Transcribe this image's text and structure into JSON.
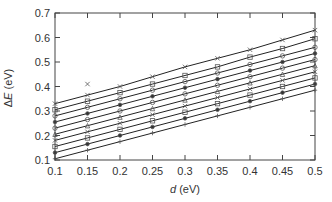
{
  "chart_data": {
    "type": "line",
    "title": "",
    "xlabel": "d (eV)",
    "ylabel": "ΔE (eV)",
    "xlim": [
      0.1,
      0.5
    ],
    "ylim": [
      0.1,
      0.7
    ],
    "xticks": [
      "0.1",
      "0.15",
      "0.2",
      "0.25",
      "0.3",
      "0.35",
      "0.4",
      "0.45",
      "0.5"
    ],
    "yticks": [
      "0.1",
      "0.2",
      "0.3",
      "0.4",
      "0.5",
      "0.6",
      "0.7"
    ],
    "grid": false,
    "legend": null,
    "x": [
      0.1,
      0.15,
      0.2,
      0.25,
      0.3,
      0.35,
      0.4,
      0.45,
      0.5
    ],
    "series": [
      {
        "name": "line1",
        "marker": "x",
        "values": [
          0.33,
          0.365,
          0.4,
          0.44,
          0.48,
          0.515,
          0.55,
          0.59,
          0.63
        ]
      },
      {
        "name": "line2",
        "marker": "square",
        "values": [
          0.305,
          0.34,
          0.375,
          0.41,
          0.445,
          0.48,
          0.52,
          0.555,
          0.595
        ]
      },
      {
        "name": "line3",
        "marker": "circle",
        "values": [
          0.28,
          0.315,
          0.35,
          0.385,
          0.42,
          0.455,
          0.49,
          0.525,
          0.56
        ]
      },
      {
        "name": "line4",
        "marker": "dot",
        "values": [
          0.255,
          0.29,
          0.325,
          0.36,
          0.395,
          0.43,
          0.465,
          0.5,
          0.535
        ]
      },
      {
        "name": "line5",
        "marker": "circle",
        "values": [
          0.23,
          0.265,
          0.3,
          0.335,
          0.37,
          0.405,
          0.44,
          0.475,
          0.51
        ]
      },
      {
        "name": "line6",
        "marker": "triangle",
        "values": [
          0.205,
          0.24,
          0.275,
          0.31,
          0.345,
          0.38,
          0.415,
          0.45,
          0.485
        ]
      },
      {
        "name": "line7",
        "marker": "x",
        "values": [
          0.18,
          0.215,
          0.25,
          0.285,
          0.32,
          0.355,
          0.39,
          0.425,
          0.46
        ]
      },
      {
        "name": "line8",
        "marker": "square",
        "values": [
          0.155,
          0.19,
          0.225,
          0.26,
          0.295,
          0.33,
          0.365,
          0.4,
          0.435
        ]
      },
      {
        "name": "line9",
        "marker": "dot",
        "values": [
          0.13,
          0.165,
          0.2,
          0.235,
          0.27,
          0.305,
          0.34,
          0.375,
          0.41
        ]
      },
      {
        "name": "line10",
        "marker": "plus",
        "values": [
          0.105,
          0.14,
          0.175,
          0.21,
          0.245,
          0.28,
          0.315,
          0.35,
          0.385
        ]
      }
    ],
    "annotations": [
      {
        "text": "x outlier",
        "x": 0.15,
        "y": 0.41
      }
    ]
  }
}
